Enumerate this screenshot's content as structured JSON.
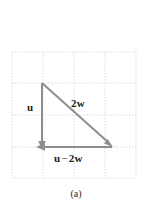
{
  "figure": {
    "caption": "(a)",
    "background_color": "#ffffff",
    "grid": {
      "color": "#d9d9dd",
      "style": "dotted",
      "x_min": 12,
      "x_max": 136,
      "y_min": 52,
      "y_max": 178,
      "columns": 4,
      "rows": 4,
      "cell_width": 31,
      "cell_height": 31.5
    },
    "vectors": [
      {
        "name": "u",
        "label_html_parts": {
          "bold": "u"
        },
        "label_text": "u",
        "color": "#8e8e8e",
        "from": {
          "x": 42,
          "y": 83
        },
        "to": {
          "x": 42,
          "y": 149
        },
        "label_position": {
          "x": 27,
          "y": 102
        }
      },
      {
        "name": "2w",
        "label_text": "2w",
        "label_coefficient": "2",
        "label_vector": "w",
        "color": "#8e8e8e",
        "from": {
          "x": 42,
          "y": 83
        },
        "to": {
          "x": 113,
          "y": 147
        },
        "label_position": {
          "x": 71,
          "y": 98
        }
      },
      {
        "name": "u-minus-2w",
        "label_text": "u − 2w",
        "label_first_vector": "u",
        "label_operator": "−",
        "label_coefficient": "2",
        "label_second_vector": "w",
        "color": "#8e8e8e",
        "from": {
          "x": 112,
          "y": 147
        },
        "to": {
          "x": 37,
          "y": 147
        },
        "label_position": {
          "x": 54,
          "y": 153
        }
      }
    ],
    "colors": {
      "vector_gray": "#8e8e8e",
      "grid_gray": "#d9d9dd",
      "text_black": "#1c1c1c",
      "caption_gray": "#2a2a2a"
    }
  }
}
